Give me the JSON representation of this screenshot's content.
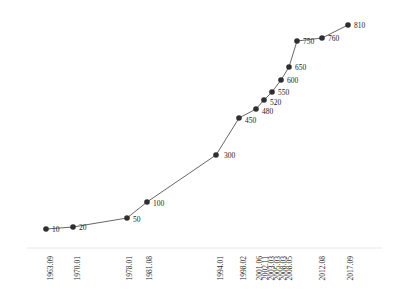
{
  "chart_data": {
    "type": "line",
    "title": "",
    "subtitle": "",
    "xlabel": "",
    "ylabel": "",
    "grid": false,
    "legend": false,
    "legend_position": "none",
    "axis_line_color": "#e8e8ec",
    "marker_color": "#2f2f33",
    "line_color": "#555558",
    "label_color": "#1a1a1a",
    "xlim": [
      0,
      1
    ],
    "ylim": [
      0,
      900
    ],
    "categories": [
      "1963.09",
      "1970.01",
      "1978.01",
      "1981.08",
      "1994.01",
      "1998.02",
      "2001.06",
      "2002.11",
      "2003.03",
      "2005.03",
      "2008.03",
      "2008.05",
      "2012.08",
      "2017.09"
    ],
    "values": [
      10,
      20,
      50,
      100,
      300,
      450,
      480,
      520,
      550,
      600,
      650,
      750,
      760,
      810
    ],
    "points": [
      {
        "x_label": "1963.09",
        "value": 10,
        "px": 46,
        "py": 229,
        "label_dx": 6,
        "label_dy": 1
      },
      {
        "x_label": "1970.01",
        "value": 20,
        "px": 73,
        "py": 227,
        "label_dx": 6,
        "label_dy": 1
      },
      {
        "x_label": "1978.01",
        "value": 50,
        "px": 127,
        "py": 218,
        "label_dx": 6,
        "label_dy": 2
      },
      {
        "x_label": "1981.08",
        "value": 100,
        "px": 147,
        "py": 202,
        "label_dx": 6,
        "label_dy": 2
      },
      {
        "x_label": "1994.01",
        "value": 300,
        "px": 216,
        "py": 155,
        "label_dx": 8,
        "label_dy": 1
      },
      {
        "x_label": "1998.02",
        "value": 450,
        "px": 239,
        "py": 118,
        "label_dx": 6,
        "label_dy": 3
      },
      {
        "x_label": "2001.06",
        "value": 480,
        "px": 256,
        "py": 109,
        "label_dx": 6,
        "label_dy": 3
      },
      {
        "x_label": "2002.11",
        "value": 520,
        "px": 264,
        "py": 100,
        "label_dx": 6,
        "label_dy": 3
      },
      {
        "x_label": "2003.03",
        "value": 550,
        "px": 272,
        "py": 92,
        "label_dx": 6,
        "label_dy": 1
      },
      {
        "x_label": "2005.03",
        "value": 600,
        "px": 281,
        "py": 80,
        "label_dx": 6,
        "label_dy": 1
      },
      {
        "x_label": "2008.03",
        "value": 650,
        "px": 289,
        "py": 67,
        "label_dx": 6,
        "label_dy": 1
      },
      {
        "x_label": "2008.05",
        "value": 750,
        "px": 297,
        "py": 41,
        "label_dx": 6,
        "label_dy": 1
      },
      {
        "x_label": "2012.08",
        "value": 760,
        "px": 322,
        "py": 38,
        "label_dx": 6,
        "label_dy": 1
      },
      {
        "x_label": "2017.09",
        "value": 810,
        "px": 348,
        "py": 25,
        "label_dx": 6,
        "label_dy": 1
      }
    ],
    "x_ticks": [
      {
        "label": "1963.09",
        "px": 50
      },
      {
        "label": "1970.01",
        "px": 77
      },
      {
        "label": "1978.01",
        "px": 129
      },
      {
        "label": "1981.08",
        "px": 149
      },
      {
        "label": "1994.01",
        "px": 220
      },
      {
        "label": "1998.02",
        "px": 243
      },
      {
        "label": "2001.06",
        "px": 259
      },
      {
        "label": "2002.11",
        "px": 265
      },
      {
        "label": "2003.03",
        "px": 271
      },
      {
        "label": "2005.03",
        "px": 277
      },
      {
        "label": "2008.03",
        "px": 283
      },
      {
        "label": "2008.05",
        "px": 289
      },
      {
        "label": "2012.08",
        "px": 322
      },
      {
        "label": "2017.09",
        "px": 350
      }
    ],
    "axis": {
      "x_axis_y": 248,
      "x_axis_start": 27,
      "x_axis_end": 382
    }
  }
}
